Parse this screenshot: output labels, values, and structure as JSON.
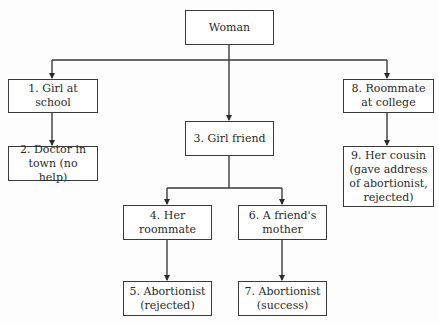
{
  "diagram": {
    "type": "tree / network flow",
    "root": {
      "id": "woman",
      "label": "Woman"
    },
    "nodes": [
      {
        "id": "n1",
        "label": "1. Girl at\nschool"
      },
      {
        "id": "n2",
        "label": "2. Doctor in\ntown (no help)"
      },
      {
        "id": "n3",
        "label": "3. Girl friend"
      },
      {
        "id": "n4",
        "label": "4. Her\nroommate"
      },
      {
        "id": "n5",
        "label": "5. Abortionist\n(rejected)"
      },
      {
        "id": "n6",
        "label": "6. A friend's\nmother"
      },
      {
        "id": "n7",
        "label": "7. Abortionist\n(success)"
      },
      {
        "id": "n8",
        "label": "8. Roommate\nat college"
      },
      {
        "id": "n9",
        "label": "9. Her cousin\n(gave address\nof abortionist,\nrejected)"
      }
    ],
    "edges": [
      {
        "from": "woman",
        "to": "n1"
      },
      {
        "from": "woman",
        "to": "n3"
      },
      {
        "from": "woman",
        "to": "n8"
      },
      {
        "from": "n1",
        "to": "n2"
      },
      {
        "from": "n3",
        "to": "n4"
      },
      {
        "from": "n3",
        "to": "n6"
      },
      {
        "from": "n4",
        "to": "n5"
      },
      {
        "from": "n6",
        "to": "n7"
      },
      {
        "from": "n8",
        "to": "n9"
      }
    ]
  }
}
